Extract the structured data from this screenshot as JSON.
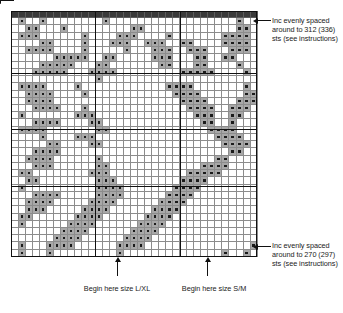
{
  "chart_data": {
    "type": "heatmap",
    "title": "",
    "xlabel": "",
    "ylabel": "",
    "columns": 35,
    "rows": 34,
    "cell_states": [
      "empty",
      "filled"
    ],
    "filled_symbol": "dot",
    "header_row_label": "cast-on edge",
    "heavy_vertical_rule_columns": [
      12,
      24
    ],
    "heavy_horizontal_rule_rows": [
      8,
      16,
      24
    ],
    "grid": [
      "00000000000000000000000000000000000",
      "01001000000001000000000000000000100",
      "00110001000000000110000000000000110",
      "01110000001000011100001000000011110",
      "00001100001000111001110011000011110",
      "00111100001000001000111001110001110",
      "00000011111001100000111000110011000",
      "00001111100011000000011000110000100",
      "00011111000111100000000011111000010",
      "00000000000010000000000000000000000",
      "01111000010000000000001111000000010",
      "00111100001000000000000111100000011",
      "00111100000000000000000011110000111",
      "00011110001000000000000001111001110",
      "01000000011100000000000000111001100",
      "00011110000110000000000000011001000",
      "01111000000011000000000000001111000",
      "00001000011100000000000000000111100",
      "00000110000110000000000000000011110",
      "00011110000000000000000000000001100",
      "00111100000010000000000000000110000",
      "00011100000011000000000000011110000",
      "01100000000111000000000001111100000",
      "00110000000011100000000011110000000",
      "01000000000011110000000111100000000",
      "00011110000011110000001111000000000",
      "00111100000111100000011110000000000",
      "00111000001111000000111100000000000",
      "01100000011110000001111000000000000",
      "01000000111100000011110000000000000",
      "00000001111000000111100000000000000",
      "00000011110000001111000000000000000",
      "01000111100000011110000000000000001",
      "01000100000000010000000000000010010"
    ]
  },
  "annotations": {
    "top_right": "Inc evenly spaced around to 312 (336) sts (see instructions)",
    "bottom_right": "Inc evenly spaced around to 270 (297) sts (see instructions)",
    "bottom_left": "Begin here size L/XL",
    "bottom_middle": "Begin here size S/M"
  },
  "icons": {
    "arrow_left": "arrow-left-icon",
    "arrow_up": "arrow-up-icon"
  },
  "colors": {
    "grid_line": "#8c8c8c",
    "heavy_rule": "#111111",
    "filled_cell": "#a8a8a8",
    "dot": "#1b1b1b",
    "header_row": "#3a3a3a",
    "background": "#ffffff",
    "text": "#1a1a1a"
  }
}
